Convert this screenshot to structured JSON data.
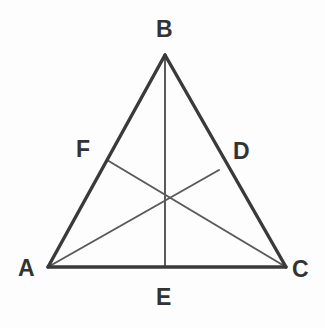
{
  "figure": {
    "background_color": "#fdfdfd",
    "side_color": "#3a3a3a",
    "cevian_color": "#5a5a5a",
    "label_color": "#333333",
    "side_width": 3.4,
    "cevian_width": 2.0
  },
  "points": {
    "A": {
      "label": "A",
      "x": 48,
      "y": 267
    },
    "B": {
      "label": "B",
      "x": 165,
      "y": 55
    },
    "C": {
      "label": "C",
      "x": 286,
      "y": 267
    },
    "D": {
      "label": "D",
      "x": 219,
      "y": 170
    },
    "E": {
      "label": "E",
      "x": 165,
      "y": 267
    },
    "F": {
      "label": "F",
      "x": 107,
      "y": 160
    },
    "G": {
      "label": "",
      "x": 165,
      "y": 200
    }
  },
  "labels": [
    {
      "text": "B",
      "name": "vertex-label-b",
      "left": 156,
      "top": 18
    },
    {
      "text": "F",
      "name": "vertex-label-f",
      "left": 76,
      "top": 138
    },
    {
      "text": "D",
      "name": "vertex-label-d",
      "left": 233,
      "top": 140
    },
    {
      "text": "A",
      "name": "vertex-label-a",
      "left": 18,
      "top": 257
    },
    {
      "text": "C",
      "name": "vertex-label-c",
      "left": 292,
      "top": 258
    },
    {
      "text": "E",
      "name": "vertex-label-e",
      "left": 156,
      "top": 286
    }
  ],
  "segments": {
    "sides": [
      {
        "name": "side-ab",
        "from": "A",
        "to": "B"
      },
      {
        "name": "side-bc",
        "from": "B",
        "to": "C"
      },
      {
        "name": "side-ac",
        "from": "A",
        "to": "C"
      }
    ],
    "cevians": [
      {
        "name": "cevian-be",
        "from": "B",
        "to": "E"
      },
      {
        "name": "cevian-ad",
        "from": "A",
        "to": "D"
      },
      {
        "name": "cevian-cf",
        "from": "C",
        "to": "F"
      }
    ]
  }
}
